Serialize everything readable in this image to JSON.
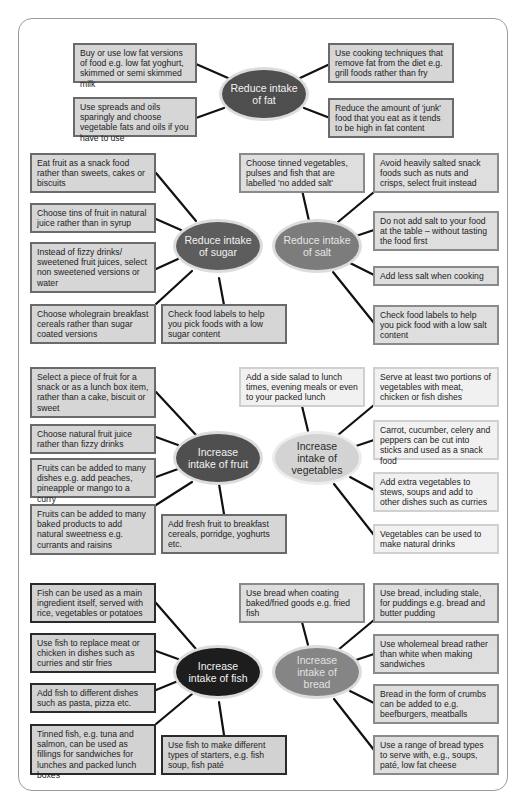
{
  "diagram": {
    "fat": {
      "hub": "Reduce intake of fat",
      "color": "#4e4e4e",
      "items": [
        "Buy or use low fat versions of food e.g. low fat yoghurt, skimmed or semi skimmed milk",
        "Use spreads and oils sparingly and choose vegetable fats and oils if you have to use",
        "Use cooking techniques that remove fat from the diet e.g. grill foods rather than fry",
        "Reduce the amount of 'junk' food that you eat as it tends to be high in fat content"
      ]
    },
    "sugar": {
      "hub": "Reduce intake of sugar",
      "color": "#5d5d5d",
      "items": [
        "Eat fruit as a snack food rather than sweets, cakes or biscuits",
        "Choose tins of fruit in natural juice rather than in syrup",
        "Instead of fizzy drinks/ sweetened fruit juices, select non sweetened versions or water",
        "Choose wholegrain breakfast cereals rather than sugar coated versions",
        "Check food labels to help you pick foods with a low sugar content"
      ]
    },
    "salt": {
      "hub": "Reduce intake of salt",
      "color": "#7c7c7c",
      "items": [
        "Choose tinned vegetables, pulses and fish that are labelled 'no added salt'",
        "Avoid heavily salted snack foods such as nuts and crisps, select fruit instead",
        "Do not add salt to your food at the table – without tasting the food first",
        "Add less salt when cooking",
        "Check food labels to help you pick food with a low salt content"
      ]
    },
    "fruit": {
      "hub": "Increase intake of fruit",
      "color": "#4f4f4f",
      "items": [
        "Select a piece of fruit for a snack or as a lunch box item, rather than a cake, biscuit or sweet",
        "Choose natural fruit juice rather than fizzy drinks",
        "Fruits can be added to many dishes e.g. add peaches, pineapple or mango to a curry",
        "Fruits can be added to many baked products to add natural sweetness e.g. currants and raisins",
        "Add fresh fruit to breakfast cereals, porridge, yoghurts etc."
      ]
    },
    "vegetables": {
      "hub": "Increase intake of vegetables",
      "color": "#d3d3d3",
      "items": [
        "Add a side salad to lunch times, evening meals or even to your packed lunch",
        "Serve at least two portions of vegetables with meat, chicken or fish dishes",
        "Carrot, cucumber, celery and peppers can be cut into sticks and used as a snack food",
        "Add extra vegetables to stews, soups and add to other dishes such as curries",
        "Vegetables can be used to make natural drinks"
      ]
    },
    "fish": {
      "hub": "Increase intake of fish",
      "color": "#1d1d1d",
      "items": [
        "Fish can be used as a main ingredient itself, served with rice, vegetables or potatoes",
        "Use fish to replace meat or chicken in dishes such as curries and stir fries",
        "Add fish to different dishes such as pasta, pizza etc.",
        "Tinned fish, e.g. tuna and salmon, can be used as fillings for sandwiches for lunches and packed lunch boxes",
        "Use fish to make different types of starters, e.g. fish soup, fish paté"
      ]
    },
    "bread": {
      "hub": "Increase intake of bread",
      "color": "#858585",
      "items": [
        "Use bread when coating baked/fried goods e.g. fried fish",
        "Use bread, including stale, for puddings e.g. bread and butter pudding",
        "Use wholemeal bread rather than white when making sandwiches",
        "Bread in the form of crumbs can be added to e.g. beefburgers, meatballs",
        "Use a range of bread types to serve with, e.g., soups, paté, low fat cheese"
      ]
    }
  }
}
